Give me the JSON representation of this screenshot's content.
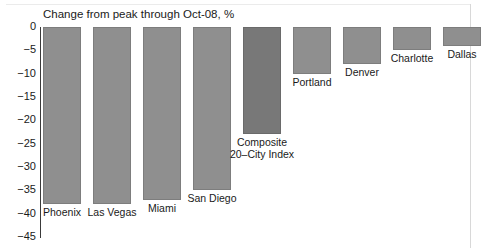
{
  "chart_data": {
    "type": "bar",
    "title": "Change from peak through Oct-08, %",
    "xlabel": "",
    "ylabel": "",
    "ylim": [
      -45,
      0
    ],
    "grid": false,
    "legend": "none",
    "orientation": "vertical",
    "categories": [
      "Phoenix",
      "Las Vegas",
      "Miami",
      "San Diego",
      "Composite 20-City Index",
      "Portland",
      "Denver",
      "Charlotte",
      "Dallas"
    ],
    "values": [
      -38,
      -38,
      -37,
      -35,
      -23,
      -10,
      -8,
      -5,
      -4
    ],
    "yticks": [
      0,
      -5,
      -10,
      -15,
      -20,
      -25,
      -30,
      -35,
      -40,
      -45
    ],
    "ytick_labels": [
      "0",
      "−5",
      "−10",
      "−15",
      "−20",
      "−25",
      "−30",
      "−35",
      "−40",
      "−45"
    ],
    "bar_color": "#8f8f8f",
    "highlight_color": "#787878",
    "highlight_index": 4,
    "label_lines": [
      [
        "Phoenix"
      ],
      [
        "Las Vegas"
      ],
      [
        "Miami"
      ],
      [
        "San Diego"
      ],
      [
        "Composite",
        "20–City Index"
      ],
      [
        "Portland"
      ],
      [
        "Denver"
      ],
      [
        "Charlotte"
      ],
      [
        "Dallas"
      ]
    ]
  }
}
